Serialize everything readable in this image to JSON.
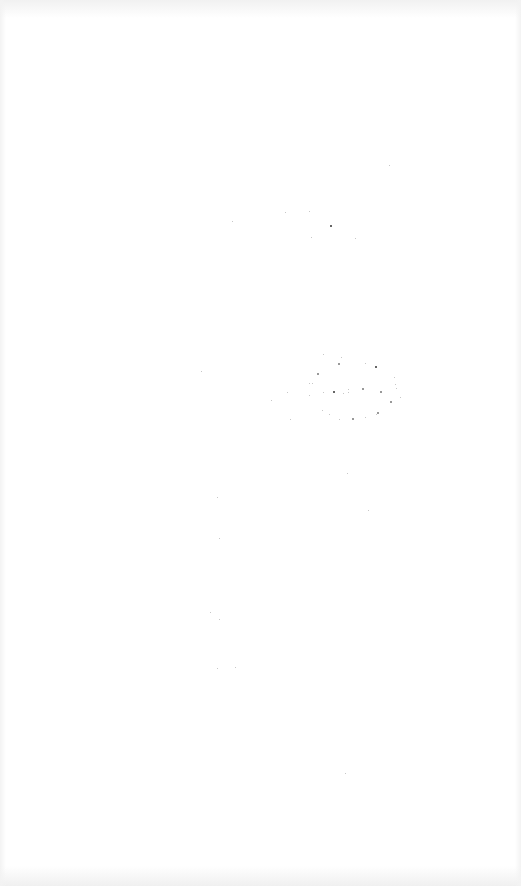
{
  "page": {
    "state": "blank",
    "background_color": "#ffffff",
    "edge_tint_color": "#f1f1f1"
  }
}
